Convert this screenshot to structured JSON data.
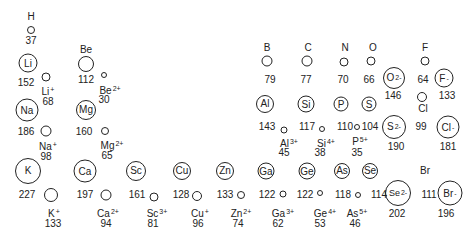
{
  "diagram": {
    "type": "atomic-and-ionic-radii",
    "units": "pm",
    "atoms": [
      {
        "symbol": "H",
        "radius": 37
      },
      {
        "symbol": "Li",
        "radius": 152
      },
      {
        "symbol": "Be",
        "radius": 112
      },
      {
        "symbol": "Na",
        "radius": 186
      },
      {
        "symbol": "Mg",
        "radius": 160
      },
      {
        "symbol": "K",
        "radius": 227
      },
      {
        "symbol": "Ca",
        "radius": 197
      },
      {
        "symbol": "Sc",
        "radius": 161
      },
      {
        "symbol": "Cu",
        "radius": 128
      },
      {
        "symbol": "Zn",
        "radius": 133
      },
      {
        "symbol": "Ga",
        "radius": 122
      },
      {
        "symbol": "Ge",
        "radius": 122
      },
      {
        "symbol": "As",
        "radius": 118
      },
      {
        "symbol": "Se",
        "radius": 114
      },
      {
        "symbol": "Br",
        "radius": 111
      },
      {
        "symbol": "B",
        "radius": 79
      },
      {
        "symbol": "C",
        "radius": 77
      },
      {
        "symbol": "N",
        "radius": 70
      },
      {
        "symbol": "O",
        "radius": 66
      },
      {
        "symbol": "F",
        "radius": 64
      },
      {
        "symbol": "Al",
        "radius": 143
      },
      {
        "symbol": "Si",
        "radius": 117
      },
      {
        "symbol": "P",
        "radius": 110
      },
      {
        "symbol": "S",
        "radius": 104
      },
      {
        "symbol": "Cl",
        "radius": 99
      }
    ],
    "cations": [
      {
        "symbol": "Li",
        "charge": "+",
        "radius": 68
      },
      {
        "symbol": "Be",
        "charge": "2+",
        "radius": 30
      },
      {
        "symbol": "Na",
        "charge": "+",
        "radius": 98
      },
      {
        "symbol": "Mg",
        "charge": "2+",
        "radius": 65
      },
      {
        "symbol": "K",
        "charge": "+",
        "radius": 133
      },
      {
        "symbol": "Ca",
        "charge": "2+",
        "radius": 94
      },
      {
        "symbol": "Sc",
        "charge": "3+",
        "radius": 81
      },
      {
        "symbol": "Cu",
        "charge": "+",
        "radius": 96
      },
      {
        "symbol": "Zn",
        "charge": "2+",
        "radius": 74
      },
      {
        "symbol": "Ga",
        "charge": "3+",
        "radius": 62
      },
      {
        "symbol": "Ge",
        "charge": "4+",
        "radius": 53
      },
      {
        "symbol": "As",
        "charge": "5+",
        "radius": 46
      },
      {
        "symbol": "Al",
        "charge": "3+",
        "radius": 45
      },
      {
        "symbol": "Si",
        "charge": "4+",
        "radius": 38
      },
      {
        "symbol": "P",
        "charge": "5+",
        "radius": 35
      }
    ],
    "anions": [
      {
        "symbol": "O",
        "charge": "2-",
        "radius": 146
      },
      {
        "symbol": "F",
        "charge": "-",
        "radius": 133
      },
      {
        "symbol": "S",
        "charge": "2-",
        "radius": 190
      },
      {
        "symbol": "Cl",
        "charge": "-",
        "radius": 181
      },
      {
        "symbol": "Se",
        "charge": "2-",
        "radius": 202
      },
      {
        "symbol": "Br",
        "charge": "-",
        "radius": 196
      }
    ]
  },
  "labels": {
    "H": "H",
    "H_r": "37",
    "Li": "Li",
    "Li_r": "152",
    "Li_ion": "Li",
    "Li_ion_c": "+",
    "Li_ion_r": "68",
    "Be": "Be",
    "Be_r": "112",
    "Be_ion": "Be",
    "Be_ion_c": "2+",
    "Be_ion_r": "30",
    "Na": "Na",
    "Na_r": "186",
    "Na_ion": "Na",
    "Na_ion_c": "+",
    "Na_ion_r": "98",
    "Mg": "Mg",
    "Mg_r": "160",
    "Mg_ion": "Mg",
    "Mg_ion_c": "2+",
    "Mg_ion_r": "65",
    "K": "K",
    "K_r": "227",
    "K_ion": "K",
    "K_ion_c": "+",
    "K_ion_r": "133",
    "Ca": "Ca",
    "Ca_r": "197",
    "Ca_ion": "Ca",
    "Ca_ion_c": "2+",
    "Ca_ion_r": "94",
    "Sc": "Sc",
    "Sc_r": "161",
    "Sc_ion": "Sc",
    "Sc_ion_c": "3+",
    "Sc_ion_r": "81",
    "Cu": "Cu",
    "Cu_r": "128",
    "Cu_ion": "Cu",
    "Cu_ion_c": "+",
    "Cu_ion_r": "96",
    "Zn": "Zn",
    "Zn_r": "133",
    "Zn_ion": "Zn",
    "Zn_ion_c": "2+",
    "Zn_ion_r": "74",
    "Ga": "Ga",
    "Ga_r": "122",
    "Ga_ion": "Ga",
    "Ga_ion_c": "3+",
    "Ga_ion_r": "62",
    "Ge": "Ge",
    "Ge_r": "122",
    "Ge_ion": "Ge",
    "Ge_ion_c": "4+",
    "Ge_ion_r": "53",
    "As": "As",
    "As_r": "118",
    "As_ion": "As",
    "As_ion_c": "5+",
    "As_ion_r": "46",
    "Se": "Se",
    "Se_r": "114",
    "Se_anion": "Se",
    "Se_anion_c": "2-",
    "Se_anion_r": "202",
    "Br": "Br",
    "Br_r": "111",
    "Br_anion": "Br",
    "Br_anion_c": "-",
    "Br_anion_r": "196",
    "B": "B",
    "B_r": "79",
    "C": "C",
    "C_r": "77",
    "N": "N",
    "N_r": "70",
    "O": "O",
    "O_r": "66",
    "O_anion": "O",
    "O_anion_c": "2-",
    "O_anion_r": "146",
    "F": "F",
    "F_r": "64",
    "F_anion": "F",
    "F_anion_c": "-",
    "F_anion_r": "133",
    "Al": "Al",
    "Al_r": "143",
    "Al_ion": "Al",
    "Al_ion_c": "3+",
    "Al_ion_r": "45",
    "Si": "Si",
    "Si_r": "117",
    "Si_ion": "Si",
    "Si_ion_c": "4+",
    "Si_ion_r": "38",
    "P": "P",
    "P_r": "110",
    "P_ion": "P",
    "P_ion_c": "5+",
    "P_ion_r": "35",
    "S": "S",
    "S_r": "104",
    "S_anion": "S",
    "S_anion_c": "2-",
    "S_anion_r": "190",
    "Cl": "Cl",
    "Cl_r": "99",
    "Cl_anion": "Cl",
    "Cl_anion_c": "-",
    "Cl_anion_r": "181"
  }
}
